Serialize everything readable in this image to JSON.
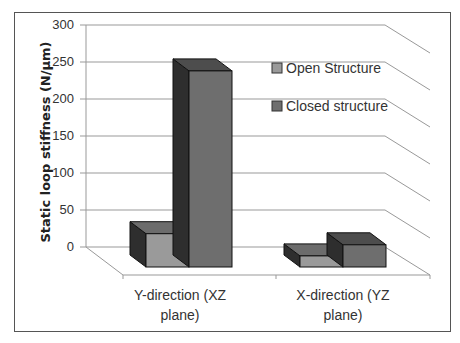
{
  "chart_data": {
    "type": "bar",
    "style": "3d-clustered-column",
    "title": "",
    "xlabel": "",
    "ylabel": "Static loop stiffness (N/µm)",
    "ylim": [
      0,
      300
    ],
    "yticks": [
      "0",
      "50",
      "100",
      "150",
      "200",
      "250",
      "300"
    ],
    "grid": true,
    "legend_position": "right-inside",
    "categories": [
      "Y-direction (XZ plane)",
      "X-direction (YZ plane)"
    ],
    "category_lines": [
      [
        "Y-direction (XZ",
        "plane)"
      ],
      [
        "X-direction (YZ",
        "plane)"
      ]
    ],
    "series": [
      {
        "name": "Open Structure",
        "values": [
          45,
          15
        ],
        "color": "#9a9a9a"
      },
      {
        "name": "Closed structure",
        "values": [
          265,
          30
        ],
        "color": "#6e6e6e"
      }
    ]
  },
  "legend": {
    "items": [
      {
        "label": "Open Structure",
        "color": "#9a9a9a"
      },
      {
        "label": "Closed structure",
        "color": "#6e6e6e"
      }
    ]
  }
}
